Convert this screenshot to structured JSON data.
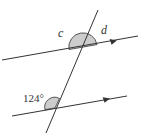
{
  "diagram": {
    "type": "parallel-lines-transversal",
    "labels": {
      "c": "c",
      "d": "d",
      "given_angle": "124°"
    },
    "colors": {
      "line": "#333333",
      "shade": "#cccccc",
      "text": "#333333"
    }
  }
}
